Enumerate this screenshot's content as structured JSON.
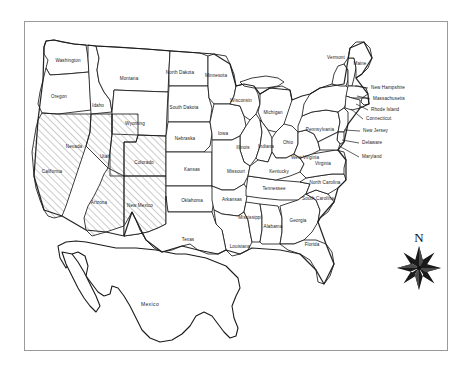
{
  "figure": {
    "type": "thematic-choropleth-map",
    "region": "United States of America",
    "projection_note": "continental US with Mexico outline",
    "frame": {
      "visible": true,
      "color": "#9a9a9a"
    }
  },
  "legend": {
    "hatched_meaning": "highlighted states (diagonal hatch fill)",
    "hatch_color": "#8c8c8c",
    "base_fill": "#ffffff",
    "border_color": "#1a1a1a"
  },
  "compass": {
    "label": "N",
    "icon": "compass-rose-icon",
    "points": 8
  },
  "countries": [
    {
      "name": "Mexico",
      "label": "Mexico",
      "x": 150,
      "y": 306
    }
  ],
  "highlighted_states": [
    "California",
    "Nevada",
    "Utah",
    "Colorado",
    "Arizona",
    "New Mexico",
    "Texas"
  ],
  "states": [
    {
      "name": "Washington",
      "label": "Washington",
      "x": 68,
      "y": 61,
      "hatched": false,
      "callout": false
    },
    {
      "name": "Oregon",
      "label": "Oregon",
      "x": 59,
      "y": 97,
      "hatched": false,
      "callout": false
    },
    {
      "name": "Idaho",
      "label": "Idaho",
      "x": 98,
      "y": 106,
      "hatched": false,
      "callout": false
    },
    {
      "name": "Montana",
      "label": "Montana",
      "x": 129,
      "y": 79,
      "hatched": false,
      "callout": false
    },
    {
      "name": "Wyoming",
      "label": "Wyoming",
      "x": 135,
      "y": 124,
      "hatched": false,
      "callout": false
    },
    {
      "name": "North Dakota",
      "label": "North Dakota",
      "x": 180,
      "y": 73,
      "hatched": false,
      "callout": false
    },
    {
      "name": "South Dakota",
      "label": "South Dakota",
      "x": 184,
      "y": 108,
      "hatched": false,
      "callout": false
    },
    {
      "name": "Nebraska",
      "label": "Nebraska",
      "x": 185,
      "y": 139,
      "hatched": false,
      "callout": false
    },
    {
      "name": "Minnesota",
      "label": "Minnesota",
      "x": 216,
      "y": 76,
      "hatched": false,
      "callout": false
    },
    {
      "name": "Iowa",
      "label": "Iowa",
      "x": 223,
      "y": 134,
      "hatched": false,
      "callout": false
    },
    {
      "name": "Wisconsin",
      "label": "Wisconsin",
      "x": 241,
      "y": 101,
      "hatched": false,
      "callout": false
    },
    {
      "name": "Michigan",
      "label": "Michigan",
      "x": 273,
      "y": 113,
      "hatched": false,
      "callout": false
    },
    {
      "name": "Illinois",
      "label": "Illinois",
      "x": 243,
      "y": 148,
      "hatched": false,
      "callout": false
    },
    {
      "name": "Indiana",
      "label": "Indiana",
      "x": 266,
      "y": 147,
      "hatched": false,
      "callout": false
    },
    {
      "name": "Ohio",
      "label": "Ohio",
      "x": 288,
      "y": 143,
      "hatched": false,
      "callout": false
    },
    {
      "name": "Kansas",
      "label": "Kansas",
      "x": 192,
      "y": 170,
      "hatched": false,
      "callout": false
    },
    {
      "name": "Missouri",
      "label": "Missouri",
      "x": 236,
      "y": 172,
      "hatched": false,
      "callout": false
    },
    {
      "name": "Kentucky",
      "label": "Kentucky",
      "x": 279,
      "y": 172,
      "hatched": false,
      "callout": false
    },
    {
      "name": "Oklahoma",
      "label": "Oklahoma",
      "x": 192,
      "y": 201,
      "hatched": false,
      "callout": false
    },
    {
      "name": "Arkansas",
      "label": "Arkansas",
      "x": 232,
      "y": 200,
      "hatched": false,
      "callout": false
    },
    {
      "name": "Tennessee",
      "label": "Tennessee",
      "x": 274,
      "y": 189,
      "hatched": false,
      "callout": false
    },
    {
      "name": "Mississippi",
      "label": "Mississippi",
      "x": 250,
      "y": 218,
      "hatched": false,
      "callout": false
    },
    {
      "name": "Alabama",
      "label": "Alabama",
      "x": 273,
      "y": 227,
      "hatched": false,
      "callout": false
    },
    {
      "name": "Georgia",
      "label": "Georgia",
      "x": 298,
      "y": 221,
      "hatched": false,
      "callout": false
    },
    {
      "name": "Florida",
      "label": "Florida",
      "x": 312,
      "y": 245,
      "hatched": false,
      "callout": false
    },
    {
      "name": "Louisiana",
      "label": "Louisiana",
      "x": 240,
      "y": 247,
      "hatched": false,
      "callout": false
    },
    {
      "name": "South Carolina",
      "label": "South Carolina",
      "x": 318,
      "y": 199,
      "hatched": false,
      "callout": false
    },
    {
      "name": "North Carolina",
      "label": "North Carolina",
      "x": 325,
      "y": 183,
      "hatched": false,
      "callout": false
    },
    {
      "name": "Virginia",
      "label": "Virginia",
      "x": 323,
      "y": 164,
      "hatched": false,
      "callout": false
    },
    {
      "name": "West Virginia",
      "label": "West Virginia",
      "x": 305,
      "y": 158,
      "hatched": false,
      "callout": false
    },
    {
      "name": "Pennsylvania",
      "label": "Pennsylvania",
      "x": 320,
      "y": 130,
      "hatched": false,
      "callout": false
    },
    {
      "name": "Vermont",
      "label": "Vermont",
      "x": 336,
      "y": 58,
      "hatched": false,
      "callout": false
    },
    {
      "name": "Maine",
      "label": "Maine",
      "x": 360,
      "y": 64,
      "hatched": false,
      "callout": false
    },
    {
      "name": "California",
      "label": "California",
      "x": 52,
      "y": 172,
      "hatched": true,
      "callout": false
    },
    {
      "name": "Nevada",
      "label": "Nevada",
      "x": 74,
      "y": 147,
      "hatched": true,
      "callout": false
    },
    {
      "name": "Utah",
      "label": "Utah",
      "x": 105,
      "y": 157,
      "hatched": true,
      "callout": false
    },
    {
      "name": "Colorado",
      "label": "Colorado",
      "x": 144,
      "y": 163,
      "hatched": true,
      "callout": false
    },
    {
      "name": "Arizona",
      "label": "Arizona",
      "x": 99,
      "y": 203,
      "hatched": true,
      "callout": false
    },
    {
      "name": "New Mexico",
      "label": "New Mexico",
      "x": 140,
      "y": 206,
      "hatched": true,
      "callout": false
    },
    {
      "name": "Texas",
      "label": "Texas",
      "x": 188,
      "y": 240,
      "hatched": true,
      "callout": false
    }
  ],
  "callout_states": [
    {
      "name": "New Hampshire",
      "label": "New Hampshire",
      "x": 371,
      "y": 88,
      "lx1": 368,
      "ly1": 88,
      "lx2": 355,
      "ly2": 86
    },
    {
      "name": "Massachusetts",
      "label": "Massachusetts",
      "x": 373,
      "y": 99,
      "lx1": 370,
      "ly1": 99,
      "lx2": 357,
      "ly2": 96
    },
    {
      "name": "Rhode Island",
      "label": "Rhode Island",
      "x": 371,
      "y": 110,
      "lx1": 368,
      "ly1": 110,
      "lx2": 356,
      "ly2": 104
    },
    {
      "name": "Connecticut",
      "label": "Connecticut",
      "x": 366,
      "y": 119,
      "lx1": 363,
      "ly1": 119,
      "lx2": 351,
      "ly2": 109
    },
    {
      "name": "New Jersey",
      "label": "New Jersey",
      "x": 363,
      "y": 131,
      "lx1": 360,
      "ly1": 131,
      "lx2": 344,
      "ly2": 130
    },
    {
      "name": "Delaware",
      "label": "Delaware",
      "x": 362,
      "y": 143,
      "lx1": 359,
      "ly1": 143,
      "lx2": 342,
      "ly2": 140
    },
    {
      "name": "Maryland",
      "label": "Maryland",
      "x": 362,
      "y": 157,
      "lx1": 359,
      "ly1": 157,
      "lx2": 341,
      "ly2": 147
    }
  ]
}
